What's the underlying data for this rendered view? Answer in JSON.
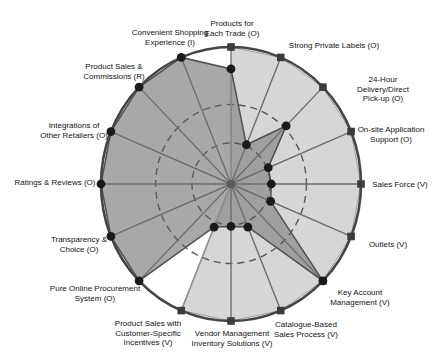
{
  "chart_data": {
    "type": "radar",
    "axes_count": 16,
    "axis_max": 1,
    "start_angle_deg": 0,
    "direction": "clockwise",
    "grid": {
      "dashed_rings_at": [
        0.3,
        0.58
      ],
      "outer_ring_at": 1.0
    },
    "legend_position": "none",
    "categories": [
      "Products for Each Trade (O)",
      "Strong Private Labels (O)",
      "24-Hour Delivery/Direct Pick-up (O)",
      "On-site Application Support (O)",
      "Sales Force (V)",
      "Outlets (V)",
      "Key Account Management (V)",
      "Catalogue-Based Sales Process (V)",
      "Vendor Management Inventory Solutions (V)",
      "Product Sales with Customer-Specific Incentives (V)",
      "Pure Online Procurement System (O)",
      "Transparency & Choice (O)",
      "Ratings & Reviews (O)",
      "Integrations of Other Retailers (O)",
      "Product Sales & Commissions (R)",
      "Convenient Shopping Experience (I)"
    ],
    "category_label_lines": [
      [
        "Products for",
        "Each Trade (O)"
      ],
      [
        "Strong Private Labels (O)"
      ],
      [
        "24-Hour",
        "Delivery/Direct",
        "Pick-up (O)"
      ],
      [
        "On-site Application",
        "Support (O)"
      ],
      [
        "Sales Force (V)"
      ],
      [
        "Outlets (V)"
      ],
      [
        "Key Account",
        "Management (V)"
      ],
      [
        "Catalogue-Based",
        "Sales Process (V)"
      ],
      [
        "Vendor Management",
        "Inventory Solutions (V)"
      ],
      [
        "Product Sales with",
        "Customer-Specific",
        "Incentives (V)"
      ],
      [
        "Pure Online Procurement",
        "System (O)"
      ],
      [
        "Transparency &",
        "Choice (O)"
      ],
      [
        "Ratings & Reviews (O)"
      ],
      [
        "Integrations of",
        "Other Retailers (O)"
      ],
      [
        "Product Sales &",
        "Commissions (R)"
      ],
      [
        "Convenient Shopping",
        "Experience (I)"
      ]
    ],
    "series": [
      {
        "name": "light-gray-polygon",
        "marker": "square",
        "fill_color": "#d6d6d6",
        "marker_color": "#3c3c3c",
        "values": [
          1.0,
          1.0,
          1.0,
          1.0,
          1.0,
          1.0,
          1.0,
          1.0,
          1.0,
          1.0,
          0.0,
          0.0,
          0.0,
          0.0,
          0.0,
          0.0
        ]
      },
      {
        "name": "dark-gray-polygon",
        "marker": "circle",
        "fill_color": "rgba(143,143,143,0.78)",
        "marker_color": "#1a1a1a",
        "values": [
          0.84,
          0.31,
          0.6,
          0.31,
          0.31,
          0.33,
          1.0,
          0.34,
          0.31,
          0.34,
          1.0,
          1.0,
          1.0,
          1.0,
          1.0,
          1.0
        ]
      }
    ],
    "colors": {
      "axis_line": "#6e6e6e",
      "outer_ring": "#454545",
      "dashed_ring": "#5a5a5a",
      "background": "#ffffff",
      "label_text": "#141414"
    }
  }
}
